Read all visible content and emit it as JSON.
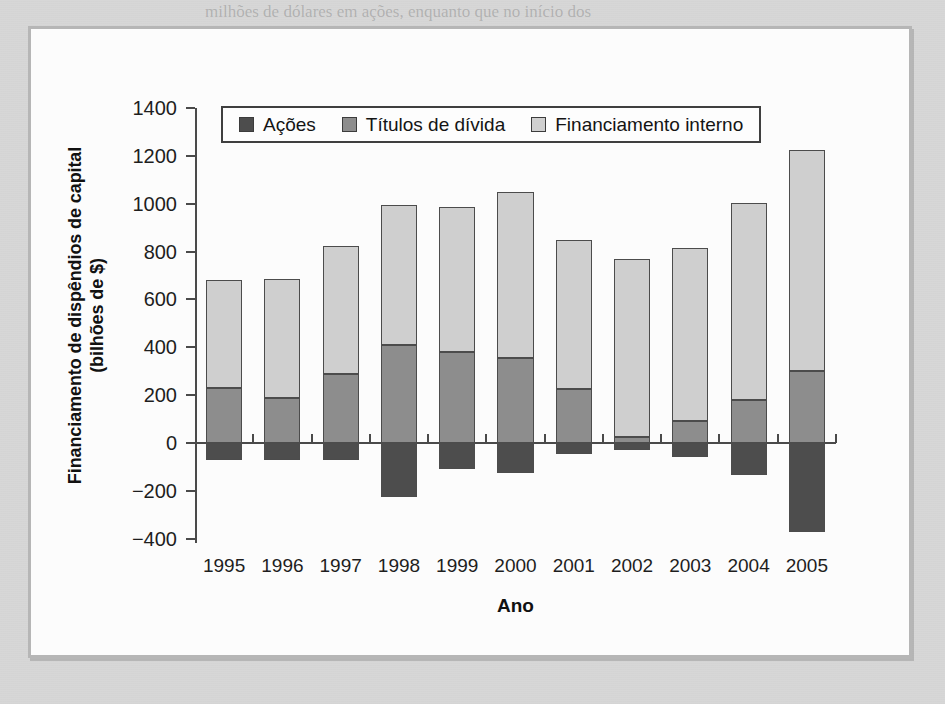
{
  "figure": {
    "frame_border_color": "#b6b6b6",
    "page_background": "#d7d7d7",
    "plot_background": "#fcfcfc"
  },
  "legend": {
    "position": "top-left-inside",
    "entries": [
      {
        "label": "Ações",
        "color": "#4d4d4d",
        "key": "equity"
      },
      {
        "label": "Títulos de dívida",
        "color": "#8d8d8d",
        "key": "debt"
      },
      {
        "label": "Financiamento interno",
        "color": "#cfcfcf",
        "key": "internal"
      }
    ]
  },
  "axes": {
    "y_title_line1": "Financiamento de dispêndios de capital",
    "y_title_line2": "(bilhões de $)",
    "x_title": "Ano",
    "y_ticks": [
      "1400",
      "1200",
      "1000",
      "800",
      "600",
      "400",
      "200",
      "0",
      "−200",
      "−400"
    ],
    "y_tick_values": [
      1400,
      1200,
      1000,
      800,
      600,
      400,
      200,
      0,
      -200,
      -400
    ],
    "ylim": [
      -400,
      1400
    ],
    "grid": false
  },
  "ghost_text": [
    {
      "text": "milhões de dólares em ações, enquanto que no início dos",
      "x": 205,
      "y": 2,
      "size": 17
    },
    {
      "text": "ções, o financiamento interno, isso depende",
      "x": 150,
      "y": 28,
      "size": 17
    },
    {
      "text": "da estrutura de capital e a maturidade média de suas",
      "x": 260,
      "y": 56,
      "size": 17
    },
    {
      "text": "Análise da firma: rentabilidade na estrutura de",
      "x": 320,
      "y": 118,
      "size": 20
    },
    {
      "text": "ações ordinárias",
      "x": 300,
      "y": 162,
      "size": 20
    },
    {
      "text": "Definição das hipóteses para a",
      "x": 415,
      "y": 205,
      "size": 22
    },
    {
      "text": "estrutura de capital de uma firma",
      "x": 395,
      "y": 240,
      "size": 18
    },
    {
      "text": "a firma pode levantar capital, o custo de seu",
      "x": 380,
      "y": 268,
      "size": 17
    },
    {
      "text": "aumentando o valor para o acionista e reduzindo",
      "x": 380,
      "y": 296,
      "size": 17
    },
    {
      "text": "as fontes de financiamento de longo prazo, os",
      "x": 380,
      "y": 324,
      "size": 17
    },
    {
      "text": "na análise dos fluxos de caixa esperados da",
      "x": 380,
      "y": 352,
      "size": 17
    },
    {
      "text": "e as preferências dos investidores na decisão de",
      "x": 380,
      "y": 380,
      "size": 17
    },
    {
      "text": "financeira.",
      "x": 380,
      "y": 408,
      "size": 17
    },
    {
      "text": "risco do negócio e o risco financeiro, que não vai",
      "x": 300,
      "y": 528,
      "size": 17
    },
    {
      "text": "para atrair as novas aquisições.",
      "x": 340,
      "y": 556,
      "size": 17
    },
    {
      "text": "2. Por que as companhias podem preferir financiar investi-",
      "x": 330,
      "y": 592,
      "size": 18
    },
    {
      "text": "mentos com lucros retidos?",
      "x": 420,
      "y": 622,
      "size": 18
    }
  ],
  "chart_data": {
    "type": "bar",
    "subtype": "stacked",
    "title": "",
    "xlabel": "Ano",
    "ylabel": "Financiamento de dispêndios de capital (bilhões de $)",
    "ylim": [
      -400,
      1400
    ],
    "categories": [
      "1995",
      "1996",
      "1997",
      "1998",
      "1999",
      "2000",
      "2001",
      "2002",
      "2003",
      "2004",
      "2005"
    ],
    "series": [
      {
        "name": "Ações",
        "color": "#4d4d4d",
        "values": [
          -70,
          -70,
          -70,
          -225,
          -110,
          -125,
          -45,
          -30,
          -60,
          -135,
          -370
        ]
      },
      {
        "name": "Títulos de dívida",
        "color": "#8d8d8d",
        "values": [
          230,
          190,
          290,
          410,
          380,
          355,
          225,
          25,
          90,
          180,
          300
        ]
      },
      {
        "name": "Financiamento interno",
        "color": "#cfcfcf",
        "values": [
          450,
          495,
          535,
          585,
          605,
          695,
          625,
          745,
          725,
          825,
          925
        ]
      }
    ],
    "stack_tops": [
      680,
      685,
      825,
      995,
      985,
      1050,
      850,
      770,
      815,
      1005,
      1225
    ],
    "legend_position": "upper left inside"
  }
}
